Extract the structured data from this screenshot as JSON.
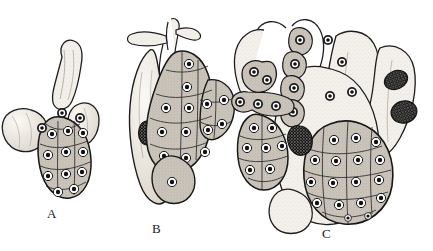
{
  "plate": {
    "title": "Stages of gland development",
    "medium": "engraving",
    "background_color": "#ffffff",
    "ink_color": "#1a1a1a",
    "tissue_fill": "#f2efe9",
    "cell_fill": "#cfc9c0",
    "nucleus_color": "#111111",
    "halo_color": "#ffffff",
    "width": 433,
    "height": 251
  },
  "figures": [
    {
      "id": "A",
      "label": "A",
      "label_x": 47,
      "label_y": 206,
      "description": "smallest stage: short tubule with a single lobed cell cluster",
      "cell_clusters": 1,
      "approx_cell_count": 16
    },
    {
      "id": "B",
      "label": "B",
      "label_x": 152,
      "label_y": 221,
      "description": "intermediate stage: branched duct with a smooth pale lobe bearing one granular nucleus and a larger cellular mass",
      "cell_clusters": 2,
      "approx_cell_count": 20
    },
    {
      "id": "C",
      "label": "C",
      "label_x": 322,
      "label_y": 226,
      "description": "most advanced stage: multiple branching tubules, chains of nucleated cells, and two large cell masses",
      "cell_clusters": 4,
      "approx_cell_count": 48
    }
  ]
}
